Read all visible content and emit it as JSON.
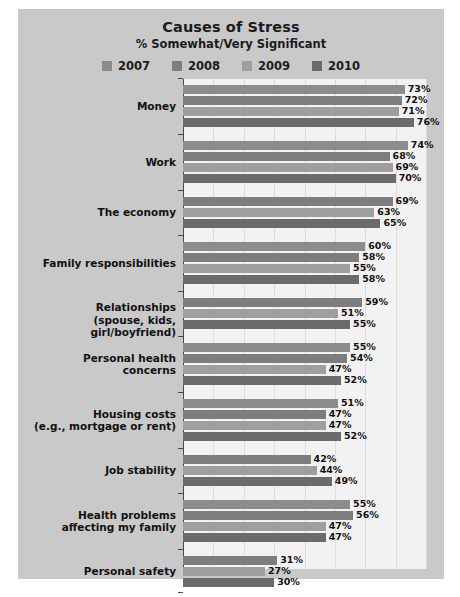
{
  "chart_data": {
    "type": "bar",
    "orientation": "horizontal",
    "title": "Causes of Stress",
    "subtitle": "% Somewhat/Very Significant",
    "xlabel": "",
    "ylabel": "",
    "xlim": [
      0,
      80
    ],
    "grid": "vertical",
    "legend_position": "top",
    "value_suffix": "%",
    "series": [
      {
        "name": "2007",
        "color": "#8c8c8c"
      },
      {
        "name": "2008",
        "color": "#7d7d7d"
      },
      {
        "name": "2009",
        "color": "#9e9e9e"
      },
      {
        "name": "2010",
        "color": "#6b6b6b"
      }
    ],
    "categories": [
      "Money",
      "Work",
      "The economy",
      "Family responsibilities",
      "Relationships\n(spouse, kids, girl/boyfriend)",
      "Personal health\nconcerns",
      "Housing costs\n(e.g., mortgage or rent)",
      "Job stability",
      "Health problems\naffecting my family",
      "Personal safety"
    ],
    "groups": [
      {
        "category": "Money",
        "label_lines": [
          "Money"
        ],
        "bars": [
          {
            "series": "2007",
            "value": 73,
            "label": "73%"
          },
          {
            "series": "2008",
            "value": 72,
            "label": "72%"
          },
          {
            "series": "2009",
            "value": 71,
            "label": "71%"
          },
          {
            "series": "2010",
            "value": 76,
            "label": "76%"
          }
        ]
      },
      {
        "category": "Work",
        "label_lines": [
          "Work"
        ],
        "bars": [
          {
            "series": "2007",
            "value": 74,
            "label": "74%"
          },
          {
            "series": "2008",
            "value": 68,
            "label": "68%"
          },
          {
            "series": "2009",
            "value": 69,
            "label": "69%"
          },
          {
            "series": "2010",
            "value": 70,
            "label": "70%"
          }
        ]
      },
      {
        "category": "The economy",
        "label_lines": [
          "The economy"
        ],
        "bars": [
          {
            "series": "2008",
            "value": 69,
            "label": "69%"
          },
          {
            "series": "2009",
            "value": 63,
            "label": "63%"
          },
          {
            "series": "2010",
            "value": 65,
            "label": "65%"
          }
        ]
      },
      {
        "category": "Family responsibilities",
        "label_lines": [
          "Family responsibilities"
        ],
        "bars": [
          {
            "series": "2007",
            "value": 60,
            "label": "60%"
          },
          {
            "series": "2008",
            "value": 58,
            "label": "58%"
          },
          {
            "series": "2009",
            "value": 55,
            "label": "55%"
          },
          {
            "series": "2010",
            "value": 58,
            "label": "58%"
          }
        ]
      },
      {
        "category": "Relationships",
        "label_lines": [
          "Relationships",
          "(spouse, kids, girl/boyfriend)"
        ],
        "bars": [
          {
            "series": "2008",
            "value": 59,
            "label": "59%"
          },
          {
            "series": "2009",
            "value": 51,
            "label": "51%"
          },
          {
            "series": "2010",
            "value": 55,
            "label": "55%"
          }
        ]
      },
      {
        "category": "Personal health concerns",
        "label_lines": [
          "Personal health",
          "concerns"
        ],
        "bars": [
          {
            "series": "2007",
            "value": 55,
            "label": "55%"
          },
          {
            "series": "2008",
            "value": 54,
            "label": "54%"
          },
          {
            "series": "2009",
            "value": 47,
            "label": "47%"
          },
          {
            "series": "2010",
            "value": 52,
            "label": "52%"
          }
        ]
      },
      {
        "category": "Housing costs",
        "label_lines": [
          "Housing costs",
          "(e.g., mortgage or rent)"
        ],
        "bars": [
          {
            "series": "2007",
            "value": 51,
            "label": "51%"
          },
          {
            "series": "2008",
            "value": 47,
            "label": "47%"
          },
          {
            "series": "2009",
            "value": 47,
            "label": "47%"
          },
          {
            "series": "2010",
            "value": 52,
            "label": "52%"
          }
        ]
      },
      {
        "category": "Job stability",
        "label_lines": [
          "Job stability"
        ],
        "bars": [
          {
            "series": "2008",
            "value": 42,
            "label": "42%"
          },
          {
            "series": "2009",
            "value": 44,
            "label": "44%"
          },
          {
            "series": "2010",
            "value": 49,
            "label": "49%"
          }
        ]
      },
      {
        "category": "Health problems affecting my family",
        "label_lines": [
          "Health problems",
          "affecting my family"
        ],
        "bars": [
          {
            "series": "2007",
            "value": 55,
            "label": "55%"
          },
          {
            "series": "2008",
            "value": 56,
            "label": "56%"
          },
          {
            "series": "2009",
            "value": 47,
            "label": "47%"
          },
          {
            "series": "2010",
            "value": 47,
            "label": "47%"
          }
        ]
      },
      {
        "category": "Personal safety",
        "label_lines": [
          "Personal safety"
        ],
        "bars": [
          {
            "series": "2008",
            "value": 31,
            "label": "31%"
          },
          {
            "series": "2009",
            "value": 27,
            "label": "27%"
          },
          {
            "series": "2010",
            "value": 30,
            "label": "30%"
          }
        ]
      }
    ]
  },
  "colors": {
    "panel_background": "#c9c9c9",
    "plot_background": "#f2f2f2",
    "gridline": "#dcdcdc",
    "axis": "#4a4a4a",
    "text": "#111111"
  }
}
